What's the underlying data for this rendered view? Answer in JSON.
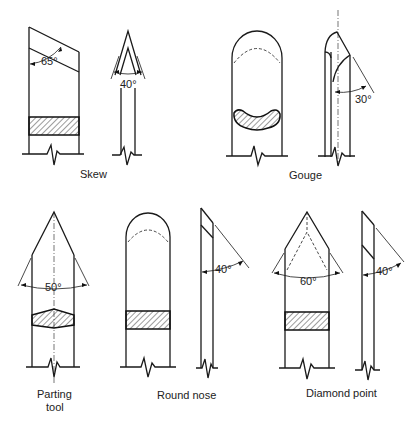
{
  "figure": {
    "tools": [
      {
        "name": "Skew",
        "angles": [
          "65°",
          "40°"
        ]
      },
      {
        "name": "Gouge",
        "angles": [
          "30°"
        ]
      },
      {
        "name": "Parting tool",
        "label_lines": [
          "Parting",
          "tool"
        ],
        "angles": [
          "50°"
        ]
      },
      {
        "name": "Round nose",
        "angles": [
          "40°"
        ]
      },
      {
        "name": "Diamond point",
        "angles": [
          "60°",
          "40°"
        ]
      }
    ],
    "labels": {
      "skew": "Skew",
      "gouge": "Gouge",
      "parting_line1": "Parting",
      "parting_line2": "tool",
      "round_nose": "Round nose",
      "diamond_point": "Diamond point"
    },
    "angles": {
      "skew_front": "65°",
      "skew_side": "40°",
      "gouge_side": "30°",
      "parting_front": "50°",
      "round_nose_side": "40°",
      "diamond_front": "60°",
      "diamond_side": "40°"
    }
  }
}
